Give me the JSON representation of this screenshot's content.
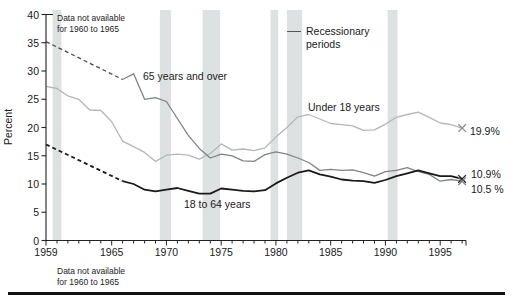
{
  "figure": {
    "ylabel": "Percent",
    "note_top": [
      "Data not available",
      "for 1960 to 1965"
    ],
    "note_bottom": [
      "Data not available",
      "for 1960 to 1965"
    ],
    "legend": {
      "lines": [
        "Recessionary",
        "periods"
      ]
    },
    "series_labels": {
      "elderly": "65 years and over",
      "children": "Under 18 years",
      "adults": "18 to 64 years"
    },
    "end_labels": {
      "children": "19.9%",
      "adults": "10.9%",
      "elderly": "10.5 %"
    }
  },
  "chart_data": {
    "type": "line",
    "title": "",
    "xlabel": "",
    "ylabel": "Percent",
    "ylim": [
      0,
      40
    ],
    "xlim": [
      1959,
      1997
    ],
    "grid": false,
    "y_ticks": [
      0,
      5,
      10,
      15,
      20,
      25,
      30,
      35,
      40
    ],
    "x_tick_labels": [
      1959,
      1965,
      1970,
      1975,
      1980,
      1985,
      1990,
      1995
    ],
    "x_minor_tick_every_year": true,
    "band_color": "#dee1e1",
    "axis_color": "#222222",
    "recession_bands": [
      [
        1959.6,
        1960.4
      ],
      [
        1969.4,
        1970.4
      ],
      [
        1973.3,
        1974.9
      ],
      [
        1979.5,
        1980.2
      ],
      [
        1981.0,
        1982.4
      ],
      [
        1990.2,
        1991.1
      ]
    ],
    "series": [
      {
        "name": "Under 18 years",
        "color": "#b4b8b8",
        "stroke_width": 1.3,
        "x_start": 1959,
        "values": [
          27.3,
          26.9,
          25.6,
          25.0,
          23.1,
          23.0,
          21.0,
          17.6,
          16.6,
          15.6,
          14.0,
          15.1,
          15.3,
          15.1,
          14.4,
          15.4,
          17.1,
          16.0,
          16.2,
          15.9,
          16.4,
          18.3,
          20.0,
          21.9,
          22.3,
          21.5,
          20.7,
          20.5,
          20.3,
          19.5,
          19.6,
          20.6,
          21.8,
          22.3,
          22.7,
          21.8,
          20.8,
          20.5,
          19.9
        ]
      },
      {
        "name": "65 years and over",
        "color": "#7f8486",
        "stroke_width": 1.3,
        "x_start": 1966,
        "values": [
          28.5,
          29.5,
          25.0,
          25.3,
          24.6,
          21.6,
          18.6,
          16.3,
          14.6,
          15.3,
          15.0,
          14.1,
          14.0,
          15.2,
          15.7,
          15.3,
          14.6,
          13.8,
          12.4,
          12.6,
          12.4,
          12.5,
          12.0,
          11.4,
          12.2,
          12.4,
          12.9,
          12.2,
          11.7,
          10.5,
          10.8,
          10.5
        ],
        "dashed_lead_in": {
          "from": [
            1959,
            35.2
          ],
          "to": [
            1966,
            28.5
          ],
          "color": "#4a4a4a",
          "note": "Data not available for 1960 to 1965"
        }
      },
      {
        "name": "18 to 64 years",
        "color": "#1a1a1a",
        "stroke_width": 1.8,
        "x_start": 1966,
        "values": [
          10.5,
          10.0,
          9.0,
          8.7,
          9.0,
          9.3,
          8.8,
          8.3,
          8.3,
          9.2,
          9.0,
          8.8,
          8.7,
          8.9,
          10.1,
          11.1,
          12.0,
          12.4,
          11.7,
          11.3,
          10.8,
          10.6,
          10.5,
          10.2,
          10.7,
          11.4,
          11.9,
          12.4,
          11.9,
          11.4,
          11.4,
          10.9
        ],
        "dashed_lead_in": {
          "from": [
            1959,
            17.0
          ],
          "to": [
            1966,
            10.5
          ],
          "color": "#1a1a1a",
          "note": "Data not available for 1960 to 1965"
        }
      }
    ],
    "end_markers": [
      {
        "year": 1997,
        "value": 19.9,
        "label": "19.9%",
        "color": "#8a8a8a"
      },
      {
        "year": 1997,
        "value": 10.9,
        "label": "10.9%",
        "color": "#1a1a1a"
      },
      {
        "year": 1997,
        "value": 10.5,
        "label": "10.5 %",
        "color": "#7f7f7f"
      }
    ],
    "legend": "Recessionary periods"
  }
}
